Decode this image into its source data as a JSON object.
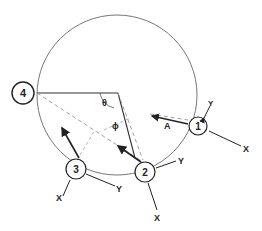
{
  "diagram": {
    "type": "geometry-schematic",
    "main_circle": {
      "cx": 117,
      "cy": 95,
      "r": 80
    },
    "nodes": [
      {
        "id": "4",
        "label": "4",
        "cx": 23,
        "cy": 93
      },
      {
        "id": "1",
        "label": "1",
        "cx": 198,
        "cy": 126
      },
      {
        "id": "2",
        "label": "2",
        "cx": 145,
        "cy": 172
      },
      {
        "id": "3",
        "label": "3",
        "cx": 76,
        "cy": 169
      }
    ],
    "angle_labels": {
      "theta": "θ",
      "phi": "ϕ"
    },
    "axis_labels": {
      "node1": {
        "x": "X",
        "y": "Y"
      },
      "node2": {
        "x": "X",
        "y": "Y"
      },
      "node3": {
        "x": "X",
        "y": "Y"
      }
    },
    "vector_label": "A"
  }
}
